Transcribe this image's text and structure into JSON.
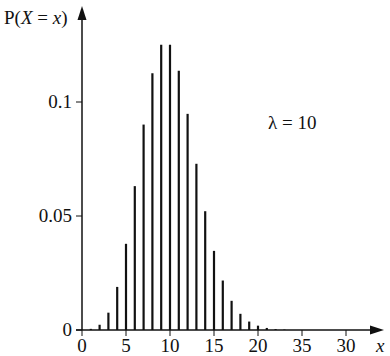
{
  "chart_data": {
    "type": "bar",
    "title": "",
    "ylabel": "P(X = x)",
    "xlabel": "x",
    "annotation": "λ = 10",
    "x_tick_labels": [
      "0",
      "5",
      "10",
      "15",
      "20",
      "35",
      "30"
    ],
    "x_tick_positions": [
      0,
      5,
      10,
      15,
      20,
      25,
      30
    ],
    "y_tick_labels": [
      "0",
      "0.05",
      "0.1"
    ],
    "y_tick_values": [
      0,
      0.05,
      0.1
    ],
    "xlim": [
      0,
      34
    ],
    "ylim": [
      0,
      0.138
    ],
    "grid": false,
    "legend": null,
    "x": [
      0,
      1,
      2,
      3,
      4,
      5,
      6,
      7,
      8,
      9,
      10,
      11,
      12,
      13,
      14,
      15,
      16,
      17,
      18,
      19,
      20,
      21,
      22,
      23,
      24,
      25
    ],
    "values": [
      0.0,
      0.0005,
      0.0023,
      0.0076,
      0.0189,
      0.0378,
      0.0631,
      0.0901,
      0.1126,
      0.1251,
      0.1251,
      0.1137,
      0.0948,
      0.0729,
      0.0521,
      0.0347,
      0.0217,
      0.0128,
      0.0071,
      0.0037,
      0.0019,
      0.0009,
      0.0004,
      0.0002,
      0.0001,
      0.0
    ],
    "bar_color": "#111111"
  },
  "labels": {
    "y_axis_title_prefix": "P(",
    "y_axis_title_var": "X",
    "y_axis_title_eq": " = ",
    "y_axis_title_val": "x",
    "y_axis_title_suffix": ")",
    "x_axis_title": "x",
    "lambda_text": "λ = 10"
  }
}
